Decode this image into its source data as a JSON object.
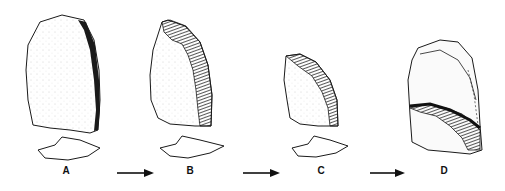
{
  "figure": {
    "type": "lithic reduction sequence illustration",
    "stages": [
      {
        "label": "A",
        "description": "unretouched flake blank with cross-section"
      },
      {
        "label": "B",
        "description": "flake with retouch along right edge, cross-section below"
      },
      {
        "label": "C",
        "description": "further reduced retouched piece, cross-section below"
      },
      {
        "label": "D",
        "description": "heavily reduced piece showing successive retouch scars"
      }
    ],
    "arrows": [
      "A→B",
      "B→C",
      "C→D"
    ],
    "colors": {
      "ink": "#1a1a1a",
      "background": "#ffffff"
    }
  }
}
